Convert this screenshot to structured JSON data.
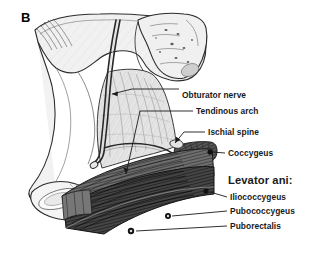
{
  "figure": {
    "panel_letter": "B",
    "background_color": "#ffffff",
    "text_color": "#1a1a1a",
    "bone_fill": "#efefef",
    "bone_outline": "#2b2b2b",
    "obturator_fill": "#e2e2e2",
    "coccygeus_fill": "#4f4f4f",
    "levator_fill": "#6a6a6a",
    "levator_dark_fill": "#3a3a3a",
    "leader_color": "#1a1a1a",
    "dot_color": "#111111"
  },
  "labels": [
    {
      "id": "obturator-nerve",
      "text": "Obturator nerve",
      "x": 182,
      "y": 91,
      "size": "sm"
    },
    {
      "id": "tendinous-arch",
      "text": "Tendinous arch",
      "x": 196,
      "y": 113,
      "size": "sm"
    },
    {
      "id": "ischial-spine",
      "text": "Ischial spine",
      "x": 208,
      "y": 134,
      "size": "sm"
    },
    {
      "id": "coccygeus",
      "text": "Coccygeus",
      "x": 228,
      "y": 155,
      "size": "sm"
    },
    {
      "id": "levator-ani",
      "text": "Levator ani:",
      "x": 228,
      "y": 181,
      "size": "grp"
    },
    {
      "id": "iliococcygeus",
      "text": "Iliococcygeus",
      "x": 230,
      "y": 199,
      "size": "sm"
    },
    {
      "id": "pubococcygeus",
      "text": "Pubococcygeus",
      "x": 230,
      "y": 213,
      "size": "sm"
    },
    {
      "id": "puborectalis",
      "text": "Puborectalis",
      "x": 230,
      "y": 228,
      "size": "sm"
    }
  ],
  "structures": [
    {
      "id": "hip-bone",
      "name": "Hip bone (ilium, ischium, pubis)"
    },
    {
      "id": "sacrum",
      "name": "Sacrum"
    },
    {
      "id": "obturator-internus",
      "name": "Obturator internus muscle"
    },
    {
      "id": "coccygeus-muscle",
      "name": "Coccygeus muscle"
    },
    {
      "id": "levator-ani-muscle",
      "name": "Levator ani muscle sheet"
    },
    {
      "id": "obturator-nerve-cord",
      "name": "Obturator nerve"
    },
    {
      "id": "tendinous-arch-line",
      "name": "Tendinous arch of levator ani"
    }
  ]
}
